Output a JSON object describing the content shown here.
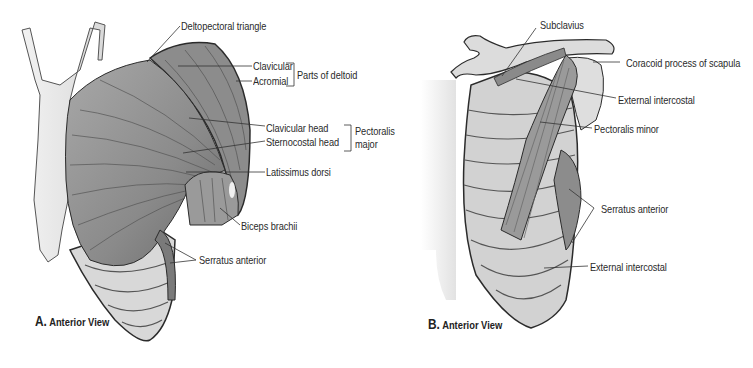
{
  "figure_a": {
    "caption_letter": "A.",
    "caption_text": "Anterior View",
    "labels": {
      "deltopectoral_triangle": "Deltopectoral triangle",
      "clavicular": "Clavicular",
      "acromial": "Acromial",
      "parts_of_deltoid": "Parts of deltoid",
      "clavicular_head": "Clavicular head",
      "sternocostal_head": "Sternocostal head",
      "pectoralis_major_line1": "Pectoralis",
      "pectoralis_major_line2": "major",
      "latissimus_dorsi": "Latissimus dorsi",
      "biceps_brachii": "Biceps brachii",
      "serratus_anterior": "Serratus anterior"
    }
  },
  "figure_b": {
    "caption_letter": "B.",
    "caption_text": "Anterior View",
    "labels": {
      "subclavius": "Subclavius",
      "coracoid_process": "Coracoid process of scapula",
      "external_intercostal_upper": "External intercostal",
      "pectoralis_minor": "Pectoralis minor",
      "serratus_anterior": "Serratus anterior",
      "external_intercostal_lower": "External intercostal"
    }
  },
  "colors": {
    "muscle": "#8f8f8f",
    "muscle_dark": "#6e6e6e",
    "bone": "#d6d6d6",
    "skin": "#e8e8e8",
    "outline": "#2b2b2b",
    "leader": "#333333"
  }
}
